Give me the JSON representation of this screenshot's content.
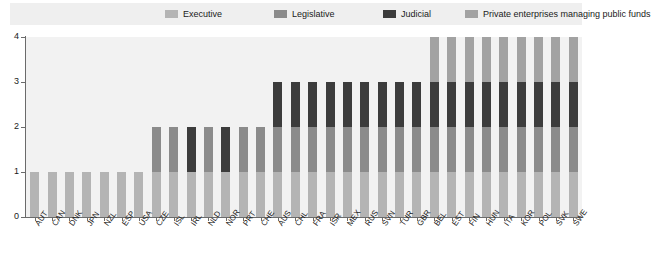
{
  "legend": {
    "items": [
      {
        "label": "Executive",
        "color": "#b4b4b4",
        "key": "executive"
      },
      {
        "label": "Legislative",
        "color": "#8b8b8b",
        "key": "legislative"
      },
      {
        "label": "Judicial",
        "color": "#3c3c3c",
        "key": "judicial"
      },
      {
        "label": "Private enterprises managing public funds",
        "color": "#a2a2a2",
        "key": "private"
      }
    ]
  },
  "axis": {
    "y_ticks": [
      "0",
      "1",
      "2",
      "3",
      "4"
    ],
    "y_min": 0,
    "y_max": 4
  },
  "chart_data": {
    "type": "bar",
    "title": "",
    "subtitle": "",
    "xlabel": "",
    "ylabel": "",
    "ylim": [
      0,
      4
    ],
    "grid": false,
    "stacked": true,
    "legend_position": "top",
    "legend_entries": [
      "Executive",
      "Legislative",
      "Judicial",
      "Private enterprises managing public funds"
    ],
    "categories": [
      "AUT",
      "CAN",
      "DNK",
      "JPN",
      "NZL",
      "ESP",
      "USA",
      "CZE",
      "ISL",
      "IRL",
      "NLD",
      "NOR",
      "PRT",
      "CHE",
      "AUS",
      "CHL",
      "FRA",
      "ISR",
      "MEX",
      "RUS",
      "SVN",
      "TUR",
      "GBR",
      "BEL",
      "EST",
      "FIN",
      "HUN",
      "ITA",
      "KOR",
      "POL",
      "SVK",
      "SWE"
    ],
    "series": [
      {
        "name": "Executive",
        "values": [
          1,
          1,
          1,
          1,
          1,
          1,
          1,
          1,
          1,
          1,
          1,
          1,
          1,
          1,
          1,
          1,
          1,
          1,
          1,
          1,
          1,
          1,
          1,
          1,
          1,
          1,
          1,
          1,
          1,
          1,
          1,
          1
        ]
      },
      {
        "name": "Legislative",
        "values": [
          0,
          0,
          0,
          0,
          0,
          0,
          0,
          1,
          1,
          0,
          1,
          0,
          1,
          1,
          1,
          1,
          1,
          1,
          1,
          1,
          1,
          1,
          1,
          1,
          1,
          1,
          1,
          1,
          1,
          1,
          1,
          1
        ]
      },
      {
        "name": "Judicial",
        "values": [
          0,
          0,
          0,
          0,
          0,
          0,
          0,
          0,
          0,
          1,
          0,
          1,
          0,
          0,
          1,
          1,
          1,
          1,
          1,
          1,
          1,
          1,
          1,
          1,
          1,
          1,
          1,
          1,
          1,
          1,
          1,
          1
        ]
      },
      {
        "name": "Private enterprises managing public funds",
        "values": [
          0,
          0,
          0,
          0,
          0,
          0,
          0,
          0,
          0,
          0,
          0,
          0,
          0,
          0,
          0,
          0,
          0,
          0,
          0,
          0,
          0,
          0,
          0,
          1,
          1,
          1,
          1,
          1,
          1,
          1,
          1,
          1
        ]
      }
    ],
    "totals": [
      1,
      1,
      1,
      1,
      1,
      1,
      1,
      2,
      2,
      2,
      2,
      2,
      2,
      2,
      3,
      3,
      3,
      3,
      3,
      3,
      3,
      3,
      3,
      4,
      4,
      4,
      4,
      4,
      4,
      4,
      4,
      4
    ]
  }
}
